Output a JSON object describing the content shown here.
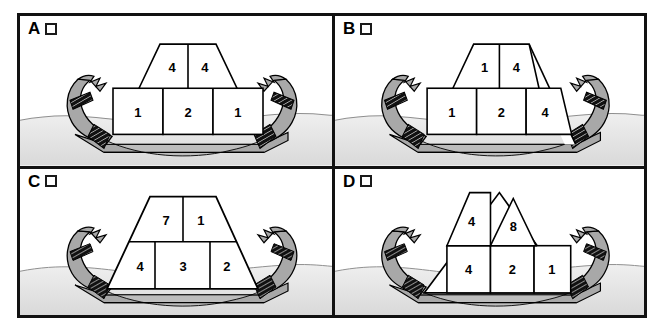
{
  "figure": {
    "panel_count": 4,
    "colors": {
      "border": "#111111",
      "boat_gray": "#a8a8a8",
      "hull_band": "#9a9a9a",
      "sand_light": "#e6e6e6",
      "water": "#d8d8d8",
      "ink": "#000000",
      "block_fill": "#ffffff"
    }
  },
  "panels": [
    {
      "id": "A",
      "letter": "A",
      "checkbox_label": "A",
      "checkbox_checked": false,
      "stack_type": "trapezoid-top-on-three-blocks",
      "rows": [
        {
          "row": "top",
          "shape": "trapezoid",
          "cells": [
            "4",
            "4"
          ]
        },
        {
          "row": "bottom",
          "shape": "rectangles",
          "cells": [
            "1",
            "2",
            "1"
          ]
        }
      ]
    },
    {
      "id": "B",
      "letter": "B",
      "checkbox_label": "B",
      "checkbox_checked": false,
      "stack_type": "slanted-right-trapezoid",
      "rows": [
        {
          "row": "top",
          "shape": "trapezoid",
          "cells": [
            "1",
            "4"
          ]
        },
        {
          "row": "bottom",
          "shape": "rectangles",
          "cells": [
            "1",
            "2",
            "4"
          ]
        }
      ]
    },
    {
      "id": "C",
      "letter": "C",
      "checkbox_label": "C",
      "checkbox_checked": false,
      "stack_type": "full-trapezoid",
      "rows": [
        {
          "row": "top",
          "shape": "trapezoid",
          "cells": [
            "7",
            "1"
          ]
        },
        {
          "row": "bottom",
          "shape": "trapezoid",
          "cells": [
            "4",
            "3",
            "2"
          ]
        }
      ]
    },
    {
      "id": "D",
      "letter": "D",
      "checkbox_label": "D",
      "checkbox_checked": false,
      "stack_type": "twin-peaks-triangle",
      "rows": [
        {
          "row": "top",
          "shape": "peaks",
          "cells": [
            "4",
            "8"
          ]
        },
        {
          "row": "bottom",
          "shape": "rectangles",
          "cells": [
            "4",
            "2",
            "1"
          ]
        }
      ]
    }
  ]
}
